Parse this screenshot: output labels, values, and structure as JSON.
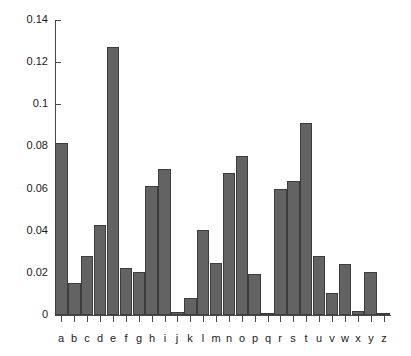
{
  "chart_data": {
    "type": "bar",
    "title": "",
    "subtitle": "",
    "xlabel": "",
    "ylabel": "",
    "categories": [
      "a",
      "b",
      "c",
      "d",
      "e",
      "f",
      "g",
      "h",
      "i",
      "j",
      "k",
      "l",
      "m",
      "n",
      "o",
      "p",
      "q",
      "r",
      "s",
      "t",
      "u",
      "v",
      "w",
      "x",
      "y",
      "z"
    ],
    "values": [
      0.0815,
      0.0152,
      0.0278,
      0.0425,
      0.127,
      0.0222,
      0.0202,
      0.061,
      0.0695,
      0.0015,
      0.008,
      0.0405,
      0.0245,
      0.0675,
      0.0755,
      0.0195,
      0.001,
      0.06,
      0.0635,
      0.091,
      0.028,
      0.0105,
      0.024,
      0.0018,
      0.0203,
      0.001
    ],
    "series": [
      {
        "name": "frequency",
        "values": [
          0.0815,
          0.0152,
          0.0278,
          0.0425,
          0.127,
          0.0222,
          0.0202,
          0.061,
          0.0695,
          0.0015,
          0.008,
          0.0405,
          0.0245,
          0.0675,
          0.0755,
          0.0195,
          0.001,
          0.06,
          0.0635,
          0.091,
          0.028,
          0.0105,
          0.024,
          0.0018,
          0.0203,
          0.001
        ]
      }
    ],
    "ylim": [
      0,
      0.14
    ],
    "y_ticks": [
      0,
      0.02,
      0.04,
      0.06,
      0.08,
      0.1,
      0.12,
      0.14
    ],
    "y_tick_labels": [
      "0",
      "0.02",
      "0.04",
      "0.06",
      "0.08",
      "0.1",
      "0.12",
      "0.14"
    ],
    "x_tick_labels": [
      "a",
      "b",
      "c",
      "d",
      "e",
      "f",
      "g",
      "h",
      "i",
      "j",
      "k",
      "l",
      "m",
      "n",
      "o",
      "p",
      "q",
      "r",
      "s",
      "t",
      "u",
      "v",
      "w",
      "x",
      "y",
      "z"
    ],
    "grid": false,
    "legend": null,
    "legend_position": "none",
    "bar_color": "#636363",
    "bar_edge_color": "#3d3d3d",
    "axis_color": "#4a4a4a",
    "background_color": "#ffffff",
    "annotations": []
  }
}
